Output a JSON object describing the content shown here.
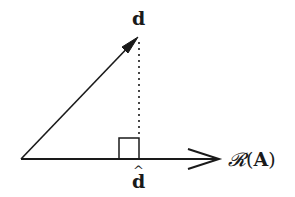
{
  "diagram": {
    "type": "vector-projection",
    "labels": {
      "vector": "d",
      "projection": "d",
      "projection_accent": "^",
      "range_prefix": "𝓡",
      "range_open": "(",
      "range_matrix": "A",
      "range_close": ")"
    },
    "geometry": {
      "origin": [
        21,
        159
      ],
      "vector_tip": [
        138,
        37
      ],
      "projection_point": [
        139,
        159
      ],
      "range_arrow_tip": [
        219,
        159
      ],
      "right_angle_box": {
        "x": 119,
        "y": 138,
        "size": 20
      }
    },
    "colors": {
      "stroke": "#1a1a1a",
      "background": "#ffffff"
    }
  }
}
